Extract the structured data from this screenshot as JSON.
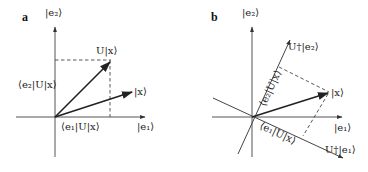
{
  "panels": [
    {
      "id": "a",
      "label": "a",
      "labels": {
        "e2": "|e₂⟩",
        "e1": "|e₁⟩",
        "Ux": "U|x⟩",
        "x": "|x⟩",
        "proj_e2": "⟨e₂|U|x⟩",
        "proj_e1": "⟨e₁|U|x⟩"
      }
    },
    {
      "id": "b",
      "label": "b",
      "labels": {
        "e2": "|e₂⟩",
        "e1": "|e₁⟩",
        "Udag_e2": "U†|e₂⟩",
        "Udag_e1": "U†|e₁⟩",
        "x": "|x⟩",
        "proj_e2": "⟨e₂|U|x⟩",
        "proj_e1": "⟨e₁|U|x⟩"
      }
    }
  ]
}
